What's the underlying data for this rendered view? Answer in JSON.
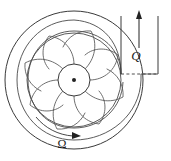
{
  "figure": {
    "background_color": "#ffffff",
    "line_color": "#3a3a3a"
  },
  "labels": {
    "flow_rate": "Q",
    "angular_velocity": "Ω"
  },
  "diagram": {
    "casing": {
      "name": "outer casing circle",
      "center_x": 74,
      "center_y": 80,
      "radius": 70
    },
    "volute": {
      "name": "spiral volute passage",
      "center_x": 74,
      "center_y": 80,
      "inner_radius": 50,
      "outer_radius": 62
    },
    "impeller": {
      "name": "impeller with backward-curved blades",
      "center_x": 74,
      "center_y": 80,
      "radius": 47,
      "blade_count": 8
    },
    "hub": {
      "name": "impeller hub",
      "center_x": 74,
      "center_y": 80,
      "radius": 16,
      "shaft_dot_radius": 2
    },
    "discharge_duct": {
      "name": "vertical discharge duct",
      "left_wall_x": 121,
      "right_wall_x": 158,
      "top_y": 16,
      "throat_y": 74
    },
    "flow_arrow": {
      "direction": "up",
      "x": 139,
      "tail_y": 48,
      "tip_y": 12
    },
    "rotation_arrow": {
      "direction": "clockwise",
      "label_x": 64,
      "label_y": 144
    }
  },
  "annotations": {
    "flow_label_x": 138,
    "flow_label_y": 56,
    "omega_label_x": 63,
    "omega_label_y": 148
  }
}
